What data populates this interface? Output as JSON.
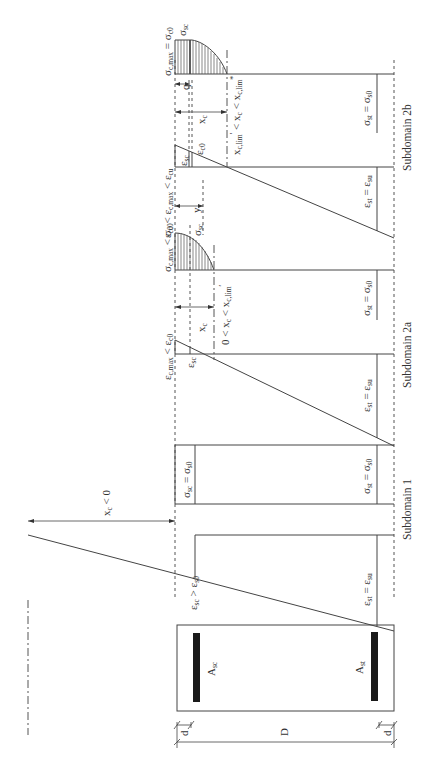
{
  "figure": {
    "orientation": "rotated-90-ccw",
    "subdomains": [
      {
        "id": "1",
        "caption": "Subdomain 1",
        "strain_labels": {
          "top": "ε_sc > ε_s0",
          "bottom": "ε_st = ε_su"
        },
        "stress_labels": {
          "top": "σ_sc = σ_s0",
          "bottom": "σ_st = σ_s0"
        },
        "neutral_axis": "x_c < 0"
      },
      {
        "id": "2a",
        "caption": "Subdomain 2a",
        "strain_labels": {
          "top_max": "ε_c,max < ε_c0",
          "steel_comp": "ε_sc",
          "bottom": "ε_st = ε_su"
        },
        "stress_labels": {
          "top_max": "σ_c,max < σ_c0",
          "steel_comp": "σ_sc",
          "bottom": "σ_st = σ_s0"
        },
        "neutral_axis": "x_c",
        "range": "0 < x_c < x'_c,lim"
      },
      {
        "id": "2b",
        "caption": "Subdomain 2b",
        "strain_labels": {
          "top_max": "ε_c0 < ε_c,max < ε_cu",
          "steel_comp": "ε_sc",
          "peak": "ε_c0",
          "bottom": "ε_st = ε_su"
        },
        "stress_labels": {
          "top_max": "σ_c,max = σ_c0",
          "steel_comp": "σ_sc",
          "bottom": "σ_st = σ_s0"
        },
        "neutral_axis": "x_c",
        "range": "x'_c,lim < x_c < x*_c,lim",
        "dims": {
          "q": "q",
          "y": "y"
        }
      }
    ],
    "section": {
      "top_steel": "A_sc",
      "bottom_steel": "A_st",
      "depth": "D",
      "cover_top": "d",
      "cover_bottom": "d"
    },
    "text": {
      "cap1": "Subdomain 1",
      "cap2a": "Subdomain 2a",
      "cap2b": "Subdomain 2b",
      "xc_neg_main": "x",
      "xc_neg_sub": "c",
      "xc_neg_rest": " < 0",
      "eps": "ε",
      "sig": "σ",
      "sc": "sc",
      "st": "st",
      "su": "su",
      "s0": "s0",
      "c0": "c0",
      "cu": "cu",
      "cmax": "c,max",
      "eq": " = ",
      "gt": " > ",
      "lt": " < ",
      "x": "x",
      "c": "c",
      "zero_lt": "0 < ",
      "clim": "c,lim",
      "prime": "′",
      "star": "*",
      "q": "q",
      "y": "y",
      "A": "A",
      "D": "D",
      "d": "d"
    }
  }
}
